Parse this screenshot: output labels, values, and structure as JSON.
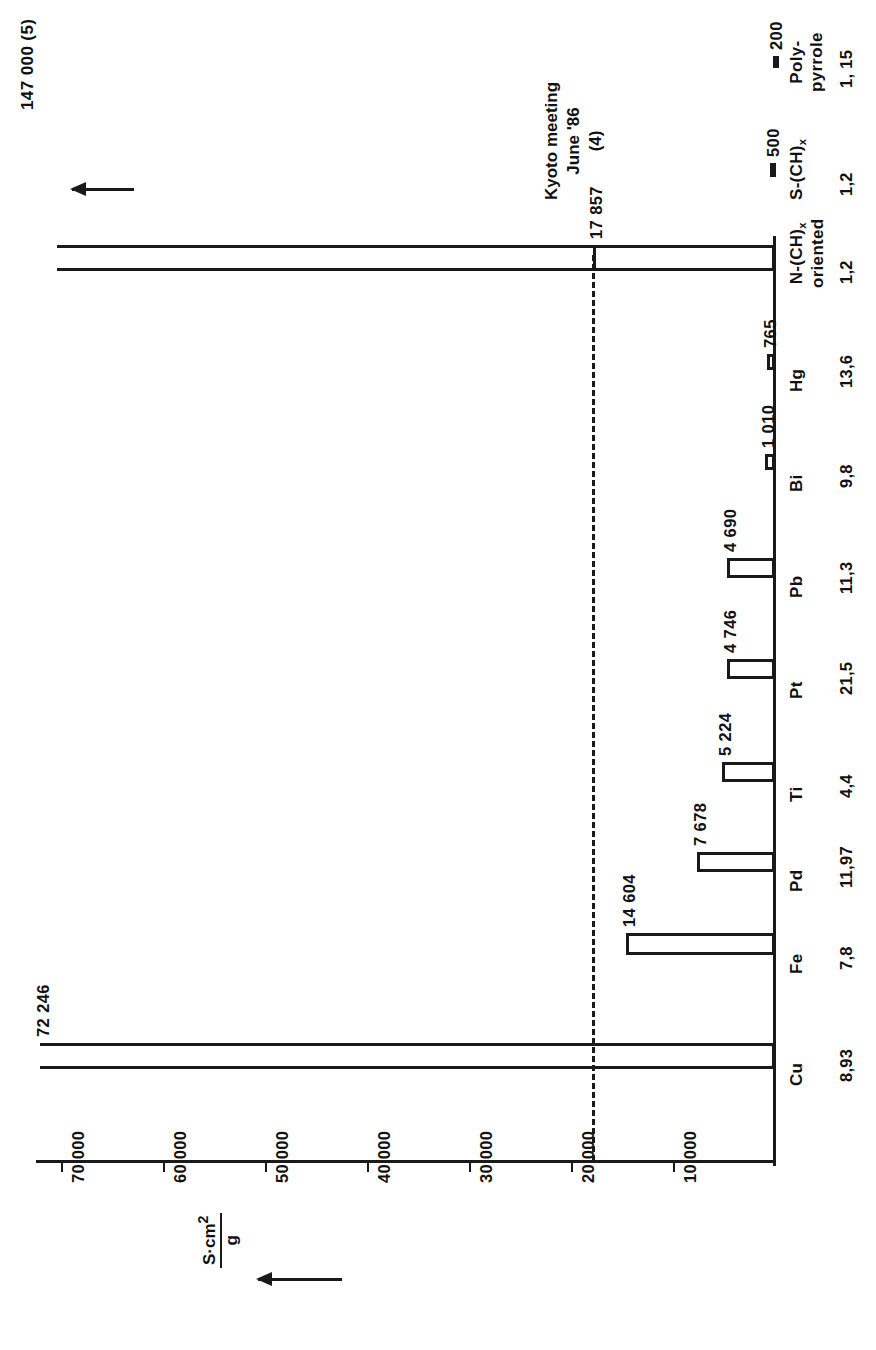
{
  "chart_data": {
    "type": "bar",
    "title": "",
    "orientation": "rotated-90",
    "xlabel": "",
    "ylabel": "S·cm² / g",
    "ylim": [
      0,
      75000
    ],
    "grid": false,
    "legend": false,
    "axis_ticks": [
      "70 000",
      "60 000",
      "50 000",
      "40 000",
      "30 000",
      "20 000",
      "10 000"
    ],
    "axis_tick_values": [
      70000,
      60000,
      50000,
      40000,
      30000,
      20000,
      10000
    ],
    "spec_weight_caption": "spec. weight :",
    "categories": [
      "Cu",
      "Fe",
      "Pd",
      "Ti",
      "Pt",
      "Pb",
      "Bi",
      "Hg",
      "N-(CH)x oriented",
      "S-(CH)x",
      "Poly-pyrrole"
    ],
    "values": [
      72246,
      14604,
      7678,
      5224,
      4746,
      4690,
      1010,
      765,
      17857,
      500,
      200
    ],
    "value_labels": [
      "72 246",
      "14 604",
      "7 678",
      "5 224",
      "4 746",
      "4 690",
      "1 010",
      "765",
      "17 857",
      "500",
      "200"
    ],
    "spec_weights": [
      "8,93",
      "7,8",
      "11,97",
      "4,4",
      "21,5",
      "11,3",
      "9,8",
      "13,6",
      "1,2",
      "1,2",
      "1, 15"
    ],
    "annotations": [
      {
        "text": "Kyoto meeting\nJune '86\n(4)",
        "at_value": 17857
      },
      {
        "text": "147 000  (5)",
        "at_value": 147000,
        "note": "off-scale, arrow"
      }
    ],
    "reference_line": {
      "value": 17857,
      "style": "dashed",
      "label": "17 857"
    }
  },
  "axis": {
    "ticks": [
      {
        "label": "70 000",
        "value": 70000
      },
      {
        "label": "60 000",
        "value": 60000
      },
      {
        "label": "50 000",
        "value": 50000
      },
      {
        "label": "40 000",
        "value": 40000
      },
      {
        "label": "30 000",
        "value": 30000
      },
      {
        "label": "20 000",
        "value": 20000
      },
      {
        "label": "10 000",
        "value": 10000
      }
    ],
    "unit_numerator": "S·cm",
    "unit_numerator_sup": "2",
    "unit_denominator": "g"
  },
  "bars": [
    {
      "cat_line1": "Cu",
      "cat_line2": "",
      "sub": "",
      "value_label": "72 246",
      "value": 72246,
      "spec_weight": "8,93",
      "style": "open"
    },
    {
      "cat_line1": "Fe",
      "cat_line2": "",
      "sub": "",
      "value_label": "14 604",
      "value": 14604,
      "spec_weight": "7,8",
      "style": "open"
    },
    {
      "cat_line1": "Pd",
      "cat_line2": "",
      "sub": "",
      "value_label": "7 678",
      "value": 7678,
      "spec_weight": "11,97",
      "style": "open"
    },
    {
      "cat_line1": "Ti",
      "cat_line2": "",
      "sub": "",
      "value_label": "5 224",
      "value": 5224,
      "spec_weight": "4,4",
      "style": "open"
    },
    {
      "cat_line1": "Pt",
      "cat_line2": "",
      "sub": "",
      "value_label": "4 746",
      "value": 4746,
      "spec_weight": "21,5",
      "style": "open"
    },
    {
      "cat_line1": "Pb",
      "cat_line2": "",
      "sub": "",
      "value_label": "4 690",
      "value": 4690,
      "spec_weight": "11,3",
      "style": "open"
    },
    {
      "cat_line1": "Bi",
      "cat_line2": "",
      "sub": "",
      "value_label": "1 010",
      "value": 1010,
      "spec_weight": "9,8",
      "style": "open"
    },
    {
      "cat_line1": "Hg",
      "cat_line2": "",
      "sub": "",
      "value_label": "765",
      "value": 765,
      "spec_weight": "13,6",
      "style": "open"
    },
    {
      "cat_line1": "N-(CH)",
      "cat_line2": "oriented",
      "sub": "x",
      "value_label": "17 857",
      "value": 17857,
      "spec_weight": "1,2",
      "style": "open"
    },
    {
      "cat_line1": "S-(CH)",
      "cat_line2": "",
      "sub": "x",
      "value_label": "500",
      "value": 500,
      "spec_weight": "1,2",
      "style": "open"
    },
    {
      "cat_line1": "Poly-",
      "cat_line2": "pyrrole",
      "sub": "",
      "value_label": "200",
      "value": 200,
      "spec_weight": "1, 15",
      "style": "filled"
    }
  ],
  "spec_weight_row": {
    "caption": "spec. weight :"
  },
  "annotations": {
    "kyoto": {
      "line1": "Kyoto meeting",
      "line2": "June '86",
      "line3": "(4)"
    },
    "offscale": {
      "label": "147 000  (5)"
    }
  },
  "colors": {
    "ink": "#1a1a1a",
    "paper": "#ffffff"
  }
}
